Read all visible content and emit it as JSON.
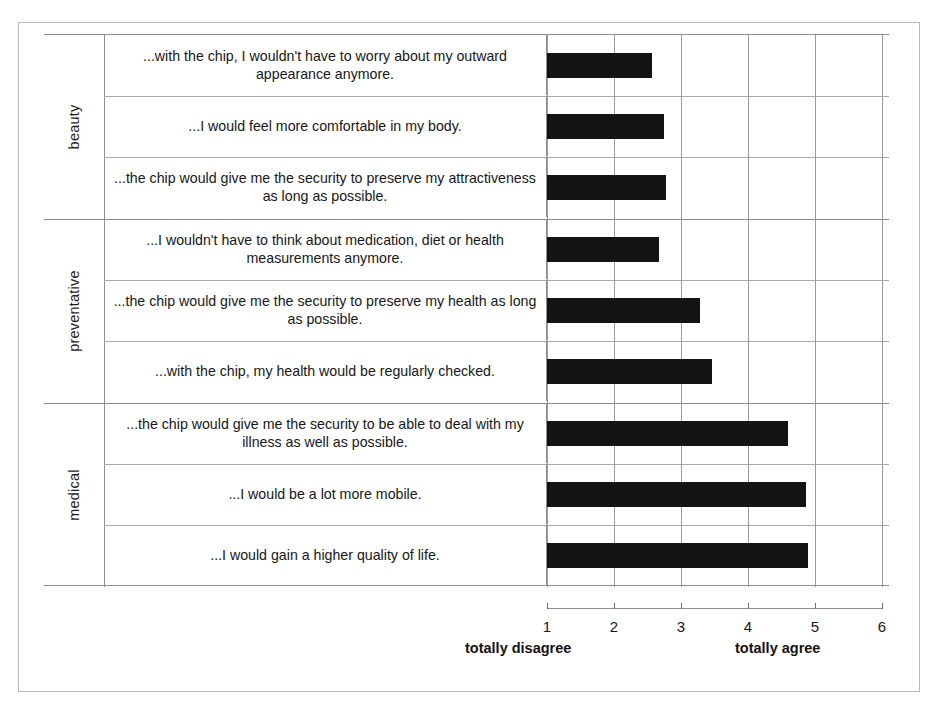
{
  "chart_data": {
    "type": "bar",
    "orientation": "horizontal",
    "title": "",
    "xlabel": "",
    "ylabel": "",
    "xlim": [
      1,
      6
    ],
    "grid": true,
    "gridlines_at": [
      1,
      2,
      3,
      4,
      5,
      6
    ],
    "x_ticks": [
      "1",
      "2",
      "3",
      "4",
      "5",
      "6"
    ],
    "scale_anchor_low": "totally disagree",
    "scale_anchor_high": "totally agree",
    "bar_color": "#141414",
    "groups": [
      {
        "label": "beauty",
        "items": [
          {
            "label": "...with the chip, I wouldn't have to worry about my outward appearance anymore.",
            "value": 2.57
          },
          {
            "label": "...I would feel more comfortable in my body.",
            "value": 2.75
          },
          {
            "label": "...the chip would give me the security to preserve my attractiveness as long as possible.",
            "value": 2.78
          }
        ]
      },
      {
        "label": "preventative",
        "items": [
          {
            "label": "...I wouldn't have to think about medication, diet or health measurements anymore.",
            "value": 2.67
          },
          {
            "label": "...the chip would give me the security to preserve my health as long as possible.",
            "value": 3.29
          },
          {
            "label": "...with the chip, my health would be regularly checked.",
            "value": 3.47
          }
        ]
      },
      {
        "label": "medical",
        "items": [
          {
            "label": "...the chip would give me the security to be able to deal with my illness as well as possible.",
            "value": 4.6
          },
          {
            "label": "...I would be a lot more mobile.",
            "value": 4.87
          },
          {
            "label": "...I would gain a higher quality of life.",
            "value": 4.9
          }
        ]
      }
    ]
  },
  "axis": {
    "ticks": [
      "1",
      "2",
      "3",
      "4",
      "5",
      "6"
    ],
    "anchor_low": "totally disagree",
    "anchor_high": "totally agree"
  },
  "groups": [
    {
      "label": "beauty"
    },
    {
      "label": "preventative"
    },
    {
      "label": "medical"
    }
  ],
  "rows": [
    {
      "label": "...with the chip, I wouldn't have to worry about my outward appearance anymore."
    },
    {
      "label": "...I would feel more comfortable in my body."
    },
    {
      "label": "...the chip would give me the security to preserve my attractiveness as long as possible."
    },
    {
      "label": "...I wouldn't have to think about medication, diet or health measurements anymore."
    },
    {
      "label": "...the chip would give me the security to preserve my health as long as possible."
    },
    {
      "label": "...with the chip, my health would be regularly checked."
    },
    {
      "label": "...the chip would give me the security to be able to deal with my illness as well as possible."
    },
    {
      "label": "...I would be a lot more mobile."
    },
    {
      "label": "...I would gain a higher quality of life."
    }
  ]
}
